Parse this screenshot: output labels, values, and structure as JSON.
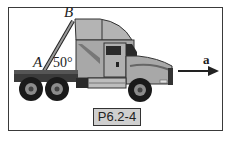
{
  "figure": {
    "label_a_point": "A",
    "label_b_point": "B",
    "angle": "50°",
    "acceleration": "a",
    "problem_id": "P6.2-4"
  },
  "colors": {
    "body": "#a8a8a8",
    "body_light": "#c4c4c4",
    "dark": "#1e1e1e",
    "tire": "#1a1a1a",
    "hub": "#8c8c8c",
    "tag_bg": "#cfcfcf",
    "border": "#3a3a3a"
  }
}
